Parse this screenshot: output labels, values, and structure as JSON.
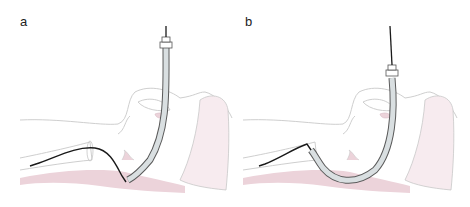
{
  "figure": {
    "panels": [
      {
        "id": "a",
        "label": "a",
        "description": "Stylet/guidewire in trachea, tube retracted into pharynx"
      },
      {
        "id": "b",
        "label": "b",
        "description": "Tube advanced over stylet into trachea"
      }
    ]
  },
  "colors": {
    "outline": "#c8c8c8",
    "tissue_pink": "#ecd3da",
    "tissue_pink_light": "#f7ebef",
    "tube_fill": "#d9dfe1",
    "tube_stroke": "#5a5a5a",
    "wire": "#1a1a1a"
  }
}
